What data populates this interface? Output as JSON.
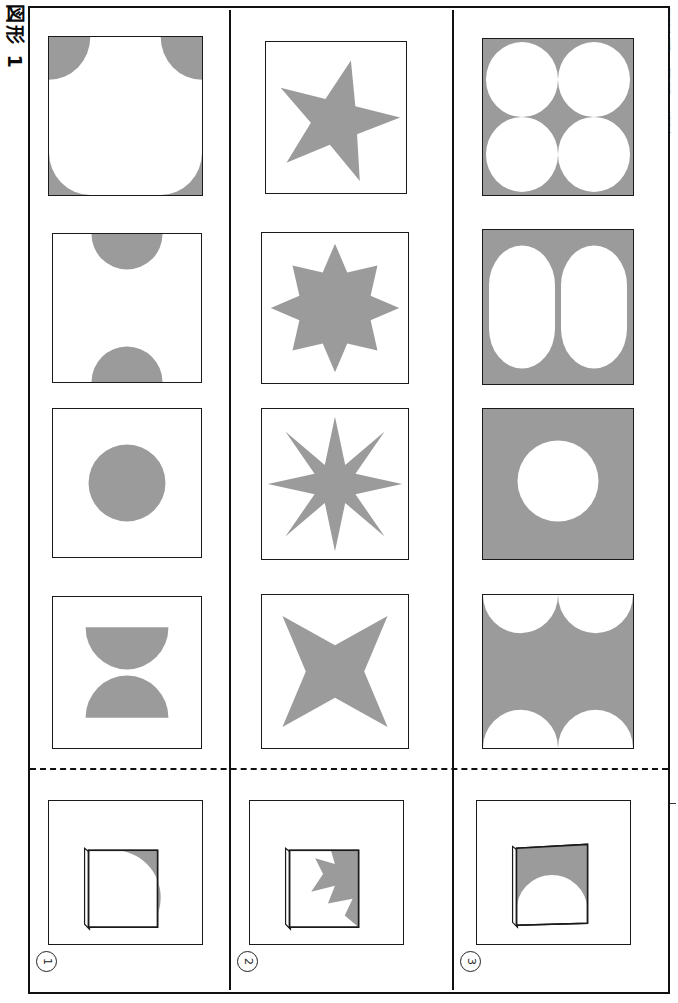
{
  "document": {
    "title_vertical": "図形 1",
    "sheet_kind": "paper-folding-puzzle-worksheet",
    "edge_microprint": "図形の折り紙パズル  練習問題プリント  小学校算数  図形認識トレーニング  解答用紙付き",
    "fill_color": "#9b9b9b",
    "line_color": "#1a1a1a",
    "background_color": "#ffffff"
  },
  "dashed_divider": {
    "label": "fold-line",
    "style": "dashed"
  },
  "rows": [
    {
      "number": "1",
      "number_label": "①",
      "options": [
        {
          "key": "1a",
          "shape": "four-corner-quarter-circles",
          "fill": "shape",
          "description": "white square with gray quarter circles at all four corners"
        },
        {
          "key": "1b",
          "shape": "two-half-circles-top-bottom",
          "fill": "shape",
          "description": "white square with gray half circles on top and bottom edges"
        },
        {
          "key": "1c",
          "shape": "centered-circle",
          "fill": "shape",
          "description": "white square with one centered gray circle"
        },
        {
          "key": "1d",
          "shape": "hourglass-two-half-circles",
          "fill": "shape",
          "description": "two gray half circles meeting point-to-point forming an hourglass"
        }
      ],
      "folded": {
        "key": "1f",
        "shape": "folded-sheet-quarter-circle-top-right",
        "description": "folded square sheet with a gray quarter circle in the top-right corner"
      }
    },
    {
      "number": "2",
      "number_label": "②",
      "options": [
        {
          "key": "2a",
          "shape": "star-5-point",
          "points": 5,
          "fill": "shape",
          "description": "gray five pointed star, slightly rotated"
        },
        {
          "key": "2b",
          "shape": "star-9-point-blunt",
          "points": 9,
          "fill": "shape",
          "description": "gray nine pointed star with shallow points"
        },
        {
          "key": "2c",
          "shape": "star-8-point-sharp",
          "points": 8,
          "fill": "shape",
          "description": "gray eight pointed star with sharp narrow points"
        },
        {
          "key": "2d",
          "shape": "star-4-point-concave",
          "points": 4,
          "fill": "shape",
          "description": "gray four pointed concave star"
        }
      ],
      "folded": {
        "key": "2f",
        "shape": "folded-sheet-star-corner",
        "description": "folded square sheet with gray star fragment in the top-right corner"
      }
    },
    {
      "number": "3",
      "number_label": "③",
      "options": [
        {
          "key": "3a",
          "shape": "four-white-circles-on-gray",
          "fill": "inverted",
          "description": "gray square with four white circles in a 2 by 2 grid"
        },
        {
          "key": "3b",
          "shape": "two-white-stadiums-on-gray",
          "fill": "inverted",
          "description": "gray square with two tall white rounded stadium shapes"
        },
        {
          "key": "3c",
          "shape": "one-white-circle-on-gray",
          "fill": "inverted",
          "description": "gray square with a single white circle in the center"
        },
        {
          "key": "3d",
          "shape": "four-white-half-circles-on-gray",
          "fill": "inverted",
          "description": "gray square with four white half circles cut from the edges"
        }
      ],
      "folded": {
        "key": "3f",
        "shape": "folded-sheet-half-circle-top",
        "description": "folded square sheet with gray region above a white half circle dome"
      }
    }
  ]
}
